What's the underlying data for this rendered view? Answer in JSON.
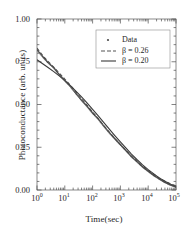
{
  "chart_data": {
    "type": "line",
    "title": "",
    "xlabel": "Time(sec)",
    "ylabel": "Photoconductance (arb. units)",
    "xscale": "log",
    "yscale": "linear",
    "xlim": [
      1,
      100000
    ],
    "ylim": [
      0.0,
      1.0
    ],
    "grid": false,
    "legend_position": "upper right",
    "xticks": [
      {
        "value": 1,
        "label": "10",
        "exponent": "0"
      },
      {
        "value": 10,
        "label": "10",
        "exponent": "1"
      },
      {
        "value": 100,
        "label": "10",
        "exponent": "2"
      },
      {
        "value": 1000,
        "label": "10",
        "exponent": "3"
      },
      {
        "value": 10000,
        "label": "10",
        "exponent": "4"
      },
      {
        "value": 100000,
        "label": "10",
        "exponent": "5"
      }
    ],
    "yticks": [
      {
        "value": 0.0,
        "label": "0.00"
      },
      {
        "value": 0.25,
        "label": "0.25"
      },
      {
        "value": 0.5,
        "label": "0.50"
      },
      {
        "value": 0.75,
        "label": "0.75"
      },
      {
        "value": 1.0,
        "label": "1.00"
      }
    ],
    "series": [
      {
        "name": "Data",
        "style": "markers",
        "marker": "dot",
        "color": "#4a4a4a",
        "x": [
          1,
          1.6,
          2.5,
          4,
          6.3,
          10,
          16,
          25,
          40,
          63,
          100,
          160,
          250,
          400,
          630,
          1000,
          1600,
          2500,
          4000,
          6300,
          10000,
          16000,
          25000,
          40000,
          63000,
          100000
        ],
        "y": [
          0.82,
          0.78,
          0.745,
          0.715,
          0.675,
          0.64,
          0.605,
          0.565,
          0.525,
          0.49,
          0.45,
          0.415,
          0.375,
          0.335,
          0.3,
          0.265,
          0.23,
          0.195,
          0.165,
          0.135,
          0.11,
          0.085,
          0.065,
          0.045,
          0.03,
          0.018
        ]
      },
      {
        "name": "β = 0.26",
        "style": "dashed",
        "color": "#555555",
        "beta": 0.26,
        "x": [
          1,
          1.6,
          2.5,
          4,
          6.3,
          10,
          16,
          25,
          40,
          63,
          100,
          160,
          250,
          400,
          630,
          1000,
          1600,
          2500,
          4000,
          6300,
          10000,
          16000,
          25000,
          40000,
          63000,
          100000
        ],
        "y": [
          0.83,
          0.787,
          0.752,
          0.718,
          0.684,
          0.649,
          0.612,
          0.574,
          0.534,
          0.496,
          0.456,
          0.417,
          0.378,
          0.338,
          0.301,
          0.266,
          0.231,
          0.198,
          0.167,
          0.139,
          0.114,
          0.091,
          0.07,
          0.052,
          0.037,
          0.025
        ]
      },
      {
        "name": "β = 0.20",
        "style": "solid",
        "color": "#3a3a3a",
        "beta": 0.2,
        "x": [
          1,
          1.6,
          2.5,
          4,
          6.3,
          10,
          16,
          25,
          40,
          63,
          100,
          160,
          250,
          400,
          630,
          1000,
          1600,
          2500,
          4000,
          6300,
          10000,
          16000,
          25000,
          40000,
          63000,
          100000
        ],
        "y": [
          0.762,
          0.738,
          0.716,
          0.692,
          0.667,
          0.64,
          0.61,
          0.578,
          0.544,
          0.509,
          0.472,
          0.434,
          0.396,
          0.356,
          0.318,
          0.281,
          0.245,
          0.21,
          0.177,
          0.147,
          0.119,
          0.094,
          0.071,
          0.051,
          0.034,
          0.02
        ]
      }
    ],
    "legend_entries": [
      {
        "label": "Data",
        "style": "markers"
      },
      {
        "label": "β = 0.26",
        "style": "dashed"
      },
      {
        "label": "β = 0.20",
        "style": "solid"
      }
    ]
  },
  "colors": {
    "axis": "#4d4d4d",
    "data_marker": "#4a4a4a",
    "curve_dashed": "#555555",
    "curve_solid": "#3a3a3a",
    "legend_border": "#8c8c8c",
    "background": "#ffffff"
  }
}
